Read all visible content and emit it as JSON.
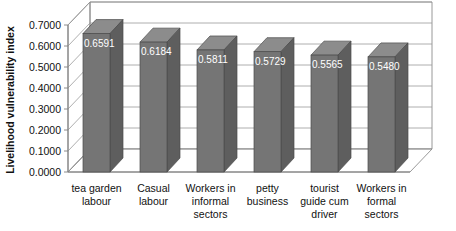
{
  "chart_data": {
    "type": "bar",
    "title": "",
    "subtitle": "",
    "xlabel": "",
    "ylabel": "Livelihood vulnerability index",
    "ylim": [
      0.0,
      0.7
    ],
    "ytick_step": 0.1,
    "ytick_labels": [
      "0.0000",
      "0.1000",
      "0.2000",
      "0.3000",
      "0.4000",
      "0.5000",
      "0.6000",
      "0.7000"
    ],
    "ytick_values": [
      0.0,
      0.1,
      0.2,
      0.3,
      0.4,
      0.5,
      0.6,
      0.7
    ],
    "categories": [
      "tea garden labour",
      "Casual labour",
      "Workers in informal sectors",
      "petty business",
      "tourist guide cum driver",
      "Workers in formal sectors"
    ],
    "category_lines": [
      [
        "tea garden",
        "labour"
      ],
      [
        "Casual",
        "labour"
      ],
      [
        "Workers in",
        "informal",
        "sectors"
      ],
      [
        "petty",
        "business"
      ],
      [
        "tourist",
        "guide cum",
        "driver"
      ],
      [
        "Workers in",
        "formal",
        "sectors"
      ]
    ],
    "values": [
      0.6591,
      0.6184,
      0.5811,
      0.5729,
      0.5565,
      0.548
    ],
    "data_labels": [
      "0.6591",
      "0.6184",
      "0.5811",
      "0.5729",
      "0.5565",
      "0.5480"
    ],
    "grid": true,
    "grid_axis": "y",
    "legend": false,
    "legend_position": "none",
    "style": "3d-column",
    "colors": {
      "bar_front": "#757575",
      "bar_side": "#5e5e5e",
      "bar_top": "#8c8c8c",
      "bar_outline": "#4a4a4a",
      "grid_line": "#9a9a9a",
      "axis_line": "#7f7f7f",
      "floor": "#ffffff",
      "back_wall": "#ffffff",
      "data_label": "#ffffff",
      "text": "#111111",
      "background": "#ffffff"
    }
  }
}
